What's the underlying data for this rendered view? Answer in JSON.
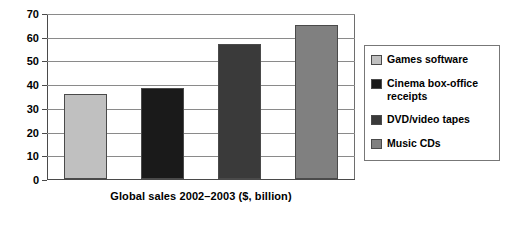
{
  "chart_data": {
    "type": "bar",
    "title": "",
    "xlabel": "Global sales 2002–2003 ($, billion)",
    "ylabel": "",
    "categories": [
      "Games software",
      "Cinema box-office receipts",
      "DVD/video tapes",
      "Music CDs"
    ],
    "values": [
      36,
      38.5,
      57,
      65
    ],
    "ylim": [
      0,
      70
    ],
    "yticks": [
      0,
      10,
      20,
      30,
      40,
      50,
      60,
      70
    ],
    "ytick_labels": [
      "0",
      "10",
      "20",
      "30",
      "40",
      "50",
      "60",
      "70"
    ],
    "grid": true,
    "grid_axis": "y",
    "legend_position": "right",
    "bar_colors": [
      "#c0c0c0",
      "#1a1a1a",
      "#3a3a3a",
      "#808080"
    ],
    "series": [
      {
        "name": "Global sales 2002–2003 ($, billion)",
        "values": [
          36,
          38.5,
          57,
          65
        ]
      }
    ]
  },
  "legend": {
    "items": [
      {
        "label": "Games software",
        "color": "#c0c0c0"
      },
      {
        "label": "Cinema box-office receipts",
        "color": "#1a1a1a"
      },
      {
        "label": "DVD/video tapes",
        "color": "#3a3a3a"
      },
      {
        "label": "Music CDs",
        "color": "#808080"
      }
    ]
  }
}
